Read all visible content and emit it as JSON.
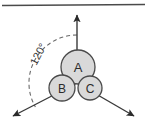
{
  "figure": {
    "title": "",
    "type": "molecular-geometry-diagram",
    "background_color": "#ffffff",
    "top_rule": {
      "visible": true,
      "color": "#4a4a4a",
      "y": 5
    }
  },
  "center": {
    "x": 77,
    "y": 83
  },
  "axes": {
    "stroke_color": "#3a3a3a",
    "arrowhead_color": "#2a2a2a",
    "items": [
      {
        "name": "axis-up",
        "direction_label": "up",
        "angle_deg": 90,
        "tip": {
          "x": 77,
          "y": 13
        }
      },
      {
        "name": "axis-lower-left",
        "direction_label": "lower-left",
        "angle_deg": 210,
        "tip": {
          "x": 10,
          "y": 118
        }
      },
      {
        "name": "axis-lower-right",
        "direction_label": "lower-right",
        "angle_deg": 330,
        "tip": {
          "x": 137,
          "y": 118
        }
      }
    ]
  },
  "angle_arc": {
    "label": "120°",
    "value": 120,
    "unit": "degrees",
    "dashed": true,
    "stroke_color": "#6a6a6a",
    "label_rotation_deg": -62,
    "label_position": {
      "x": 38,
      "y": 54
    },
    "radius": 48
  },
  "atoms": [
    {
      "id": "A",
      "label": "A",
      "cx": 78,
      "cy": 67,
      "r": 17,
      "fill": "#d9d9d9",
      "stroke": "#4a4a4a"
    },
    {
      "id": "B",
      "label": "B",
      "cx": 62,
      "cy": 88,
      "r": 13,
      "fill": "#d9d9d9",
      "stroke": "#4a4a4a"
    },
    {
      "id": "C",
      "label": "C",
      "cx": 90,
      "cy": 88,
      "r": 12,
      "fill": "#d9d9d9",
      "stroke": "#4a4a4a"
    }
  ],
  "colors": {
    "atom_fill": "#d9d9d9",
    "atom_stroke": "#4a4a4a",
    "axis_stroke": "#3a3a3a",
    "arc_stroke": "#6a6a6a",
    "text": "#2b2b2b",
    "rule": "#4a4a4a"
  }
}
